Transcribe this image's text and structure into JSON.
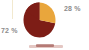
{
  "figure": {
    "name": "pie-chart-figure",
    "background_color": "#ffffff"
  },
  "colors": {
    "slice_orange": "#e9a63c",
    "slice_dark_red": "#7d1d16",
    "label_gray": "#8c8c8c",
    "axis_rule_cream": "#f2e9cf"
  },
  "labels": {
    "slice_1_pct": "28 %",
    "slice_2_pct": "72 %"
  },
  "legend": {
    "swatch_color": "#7d1d16"
  },
  "chart_data": {
    "type": "pie",
    "title": "",
    "subtitle": "",
    "xlabel": "",
    "ylabel": "",
    "grid": false,
    "legend_position": "bottom",
    "start_angle_deg": 90,
    "direction": "clockwise",
    "categories": [
      "Series 1",
      "Series 2"
    ],
    "values": [
      28,
      72
    ],
    "data_labels": [
      "28 %",
      "72 %"
    ],
    "slice_colors": [
      "#e9a63c",
      "#7d1d16"
    ],
    "annotations": [
      {
        "text": "28 %",
        "position": "outside-upper-right",
        "color": "#8c8c8c"
      },
      {
        "text": "72 %",
        "position": "outside-left",
        "color": "#8c8c8c"
      }
    ]
  }
}
